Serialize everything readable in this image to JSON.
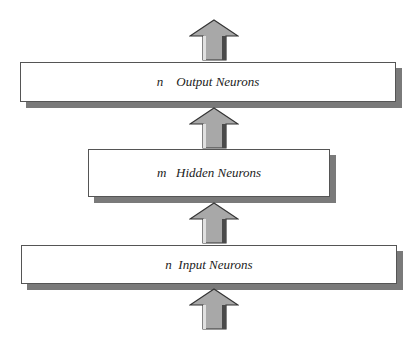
{
  "diagram": {
    "type": "layered-neural-network",
    "layers": [
      {
        "id": "output",
        "var": "n",
        "label": "Output Neurons",
        "display": "n    Output Neurons"
      },
      {
        "id": "hidden",
        "var": "m",
        "label": "Hidden Neurons",
        "display": "m   Hidden Neurons"
      },
      {
        "id": "input",
        "var": "n",
        "label": "Input Neurons",
        "display": "n  Input Neurons"
      }
    ],
    "arrows": [
      {
        "id": "arrow-out-top",
        "direction": "up"
      },
      {
        "id": "arrow-hidden-to-output",
        "direction": "up"
      },
      {
        "id": "arrow-input-to-hidden",
        "direction": "up"
      },
      {
        "id": "arrow-into-input",
        "direction": "up"
      }
    ],
    "colors": {
      "box_fill": "#ffffff",
      "box_border": "#555555",
      "shadow": "#7a7a7a",
      "arrow_fill": "#a8a8a8",
      "arrow_dark": "#4a4a4a",
      "arrow_light": "#e0e0e0"
    }
  }
}
